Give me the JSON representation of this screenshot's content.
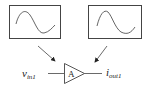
{
  "diagram": {
    "input_waveform": {
      "label": "input-sine-waveform",
      "shape": "sine"
    },
    "output_waveform": {
      "label": "output-sine-waveform",
      "shape": "sine (shifted)"
    },
    "amplifier": {
      "symbol": "A"
    },
    "input_label": {
      "main": "v",
      "sub": "in1"
    },
    "output_label": {
      "main": "i",
      "sub": "out1"
    },
    "colors": {
      "stroke": "#333333",
      "background": "#ffffff"
    }
  }
}
